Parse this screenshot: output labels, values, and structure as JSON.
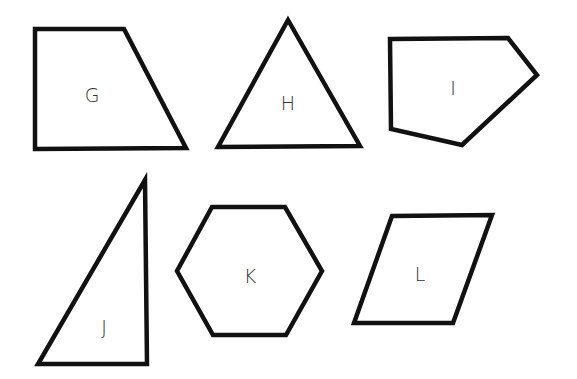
{
  "diagram": {
    "title": "",
    "stroke_color": "#111111",
    "background": "#ffffff",
    "shapes": [
      {
        "label": "G",
        "type": "trapezoid",
        "points": "35,29 124,29 186,148 35,149",
        "label_x": 92,
        "label_y": 96
      },
      {
        "label": "H",
        "type": "triangle",
        "points": "288,20 360,146 218,147",
        "label_x": 288,
        "label_y": 104
      },
      {
        "label": "I",
        "type": "pentagon",
        "points": "390,39 508,38 537,75 462,145 391,129",
        "label_x": 453,
        "label_y": 89
      },
      {
        "label": "J",
        "type": "right-triangle",
        "points": "145,180 147,364 38,364",
        "label_x": 104,
        "label_y": 328
      },
      {
        "label": "K",
        "type": "hexagon",
        "points": "212,207 285,207 322,271 286,335 213,335 177,271",
        "label_x": 250,
        "label_y": 277
      },
      {
        "label": "L",
        "type": "parallelogram",
        "points": "392,216 492,215 453,323 354,323",
        "label_x": 420,
        "label_y": 275
      }
    ]
  }
}
